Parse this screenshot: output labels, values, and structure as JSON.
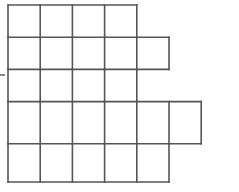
{
  "figure": {
    "name": "irregular-grid-polyomino",
    "background_color": "#ffffff",
    "line_color": "#555555",
    "line_width": 1.6,
    "cell_size": 32.2,
    "origin": {
      "x": 8,
      "y": 5
    },
    "rows": [
      {
        "index": 1,
        "cells": 4,
        "start_col": 0,
        "y_top": 5,
        "y_bottom": 37.2
      },
      {
        "index": 2,
        "cells": 5,
        "start_col": 0,
        "y_top": 37.2,
        "y_bottom": 69.4
      },
      {
        "index": 3,
        "cells": 4,
        "start_col": 0,
        "y_top": 69.4,
        "y_bottom": 101.6
      },
      {
        "index": 4,
        "cells": 6,
        "start_col": 0,
        "y_top": 101.6,
        "y_bottom": 143.8
      },
      {
        "index": 5,
        "cells": 5,
        "start_col": 0,
        "y_top": 143.8,
        "y_bottom": 182
      }
    ],
    "total_cells": 24,
    "tick_mark": {
      "name": "left-edge-tick",
      "x1": 0,
      "x2": 5,
      "y": 75
    }
  },
  "chart_data": {
    "type": "table",
    "title": "",
    "categories": [
      "Row 1",
      "Row 2",
      "Row 3",
      "Row 4",
      "Row 5"
    ],
    "values": [
      4,
      5,
      4,
      6,
      5
    ],
    "xlabel": "",
    "ylabel": "Squares per row",
    "ylim": [
      0,
      6
    ]
  }
}
